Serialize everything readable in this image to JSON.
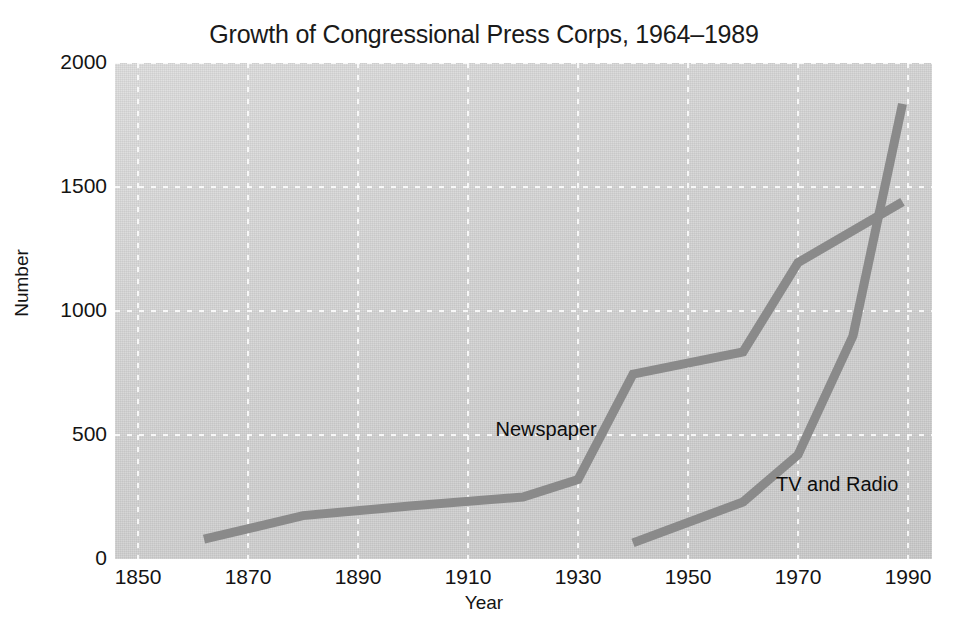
{
  "chart_data": {
    "type": "line",
    "title": "Growth of Congressional Press Corps, 1964–1989",
    "xlabel": "Year",
    "ylabel": "Number",
    "xlim": [
      1850,
      1990
    ],
    "ylim": [
      0,
      2000
    ],
    "xticks": [
      "1850",
      "1870",
      "1890",
      "1910",
      "1930",
      "1950",
      "1970",
      "1990"
    ],
    "xtick_values": [
      1850,
      1870,
      1890,
      1910,
      1930,
      1950,
      1970,
      1990
    ],
    "yticks": [
      "0",
      "500",
      "1000",
      "1500",
      "2000"
    ],
    "ytick_values": [
      0,
      500,
      1000,
      1500,
      2000
    ],
    "grid": true,
    "grid_style": "dashed-white",
    "legend_position": "inline-annotation",
    "plot_background": "#d4d4d4",
    "line_color": "#8a8a8a",
    "line_width": 9,
    "series": [
      {
        "name": "Newspaper",
        "label_text": "Newspaper",
        "color": "#8a8a8a",
        "x": [
          1862,
          1880,
          1900,
          1920,
          1930,
          1940,
          1960,
          1970,
          1989
        ],
        "values": [
          80,
          175,
          215,
          250,
          320,
          745,
          835,
          1195,
          1440
        ]
      },
      {
        "name": "TV and Radio",
        "label_text": "TV and Radio",
        "color": "#8a8a8a",
        "x": [
          1940,
          1960,
          1970,
          1980,
          1989
        ],
        "values": [
          65,
          230,
          420,
          900,
          1835
        ]
      }
    ],
    "annotations": [
      {
        "text": "Newspaper",
        "x": 1915,
        "y": 520
      },
      {
        "text": "TV and Radio",
        "x": 1966,
        "y": 300
      }
    ]
  },
  "axes": {
    "y_title": "Number",
    "x_title": "Year"
  }
}
